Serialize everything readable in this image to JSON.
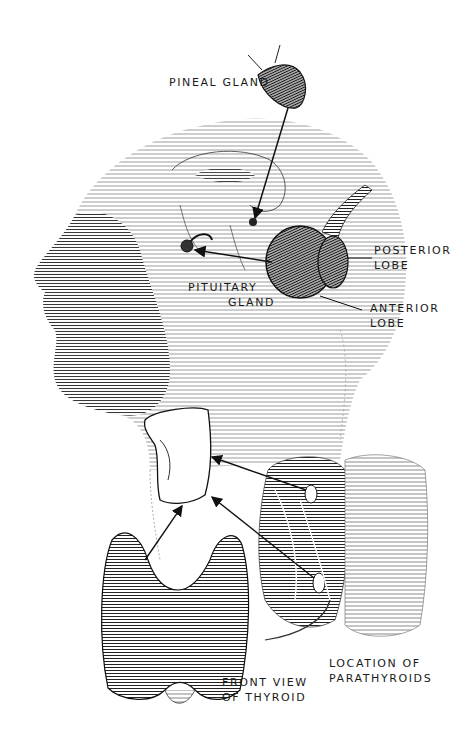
{
  "figure": {
    "background": "#ffffff",
    "ink_color": "#1a1a1a"
  },
  "labels": {
    "pineal": {
      "line1": "PINEAL GLAND"
    },
    "posterior_lobe": {
      "line1": "POSTERIOR",
      "line2": "LOBE"
    },
    "anterior_lobe": {
      "line1": "ANTERIOR",
      "line2": "LOBE"
    },
    "pituitary": {
      "line1": "PITUITARY",
      "line2": "GLAND"
    },
    "thyroid_front": {
      "line1": "FRONT VIEW",
      "line2": "OF THYROID"
    },
    "parathyroids": {
      "line1": "LOCATION OF",
      "line2": "PARATHYROIDS"
    }
  }
}
